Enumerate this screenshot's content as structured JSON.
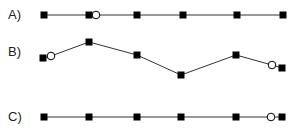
{
  "rows": [
    {
      "label": "A)",
      "label_y": 7,
      "points": [
        [
          44,
          15,
          "sq"
        ],
        [
          89,
          15,
          "sq"
        ],
        [
          96,
          15,
          "ci"
        ],
        [
          137,
          15,
          "sq"
        ],
        [
          183,
          15,
          "sq"
        ],
        [
          237,
          15,
          "sq"
        ],
        [
          283,
          15,
          "sq"
        ]
      ]
    },
    {
      "label": "B)",
      "label_y": 44,
      "points": [
        [
          43,
          58,
          "sq"
        ],
        [
          51,
          56,
          "ci"
        ],
        [
          89,
          42,
          "sq"
        ],
        [
          137,
          55,
          "sq"
        ],
        [
          181,
          75,
          "sq"
        ],
        [
          236,
          55,
          "sq"
        ],
        [
          272,
          65,
          "ci"
        ],
        [
          282,
          68,
          "sq"
        ]
      ]
    },
    {
      "label": "C)",
      "label_y": 109,
      "points": [
        [
          44,
          117,
          "sq"
        ],
        [
          89,
          117,
          "sq"
        ],
        [
          137,
          117,
          "sq"
        ],
        [
          181,
          117,
          "sq"
        ],
        [
          236,
          117,
          "sq"
        ],
        [
          271,
          117,
          "ci"
        ],
        [
          282,
          117,
          "sq"
        ]
      ]
    }
  ]
}
